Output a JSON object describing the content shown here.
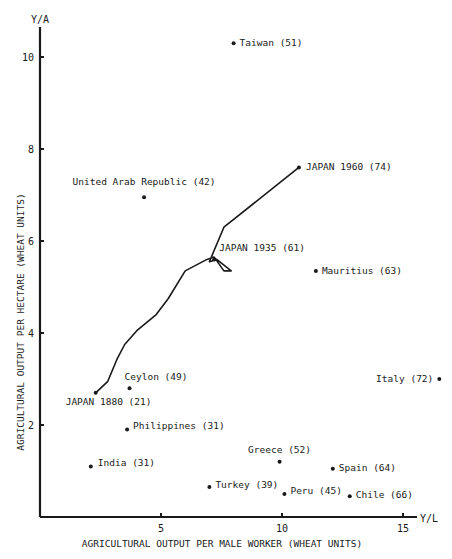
{
  "chart_data": {
    "type": "scatter",
    "title": "",
    "xlabel": "AGRICULTURAL OUTPUT PER MALE WORKER (WHEAT UNITS)",
    "ylabel": "AGRICULTURAL OUTPUT PER HECTARE (WHEAT UNITS)",
    "x_axis_end_label": "Y/L",
    "y_axis_end_label": "Y/A",
    "xlim": [
      0,
      16
    ],
    "ylim": [
      0,
      10.8
    ],
    "x_ticks": [
      5,
      10,
      15
    ],
    "y_ticks": [
      2,
      4,
      6,
      8,
      10
    ],
    "grid": false,
    "points": [
      {
        "label": "Taiwan (51)",
        "x": 8.0,
        "y": 10.3
      },
      {
        "label": "United Arab Republic (42)",
        "x": 4.3,
        "y": 6.95
      },
      {
        "label": "Mauritius (63)",
        "x": 11.4,
        "y": 5.35
      },
      {
        "label": "Ceylon (49)",
        "x": 3.7,
        "y": 2.8
      },
      {
        "label": "Italy (72)",
        "x": 16.5,
        "y": 3.0
      },
      {
        "label": "Philippines (31)",
        "x": 3.6,
        "y": 1.9
      },
      {
        "label": "India (31)",
        "x": 2.1,
        "y": 1.1
      },
      {
        "label": "Greece (52)",
        "x": 9.9,
        "y": 1.2
      },
      {
        "label": "Spain (64)",
        "x": 12.1,
        "y": 1.05
      },
      {
        "label": "Turkey (39)",
        "x": 7.0,
        "y": 0.65
      },
      {
        "label": "Peru (45)",
        "x": 10.1,
        "y": 0.5
      },
      {
        "label": "Chile (66)",
        "x": 12.8,
        "y": 0.45
      }
    ],
    "series": [
      {
        "name": "Japan 1880-1960",
        "labels": [
          {
            "label": "JAPAN 1880 (21)",
            "x": 2.3,
            "y": 2.7
          },
          {
            "label": "JAPAN 1935 (61)",
            "x": 7.2,
            "y": 5.6
          },
          {
            "label": "JAPAN 1960 (74)",
            "x": 10.7,
            "y": 7.6
          }
        ],
        "path": [
          [
            2.3,
            2.7
          ],
          [
            2.8,
            2.95
          ],
          [
            3.2,
            3.45
          ],
          [
            3.5,
            3.75
          ],
          [
            4.0,
            4.05
          ],
          [
            4.8,
            4.4
          ],
          [
            5.3,
            4.75
          ],
          [
            6.0,
            5.35
          ],
          [
            6.9,
            5.6
          ],
          [
            7.2,
            5.65
          ],
          [
            7.6,
            5.35
          ],
          [
            7.9,
            5.35
          ],
          [
            7.3,
            5.6
          ],
          [
            7.0,
            5.55
          ],
          [
            7.6,
            6.3
          ],
          [
            10.7,
            7.6
          ]
        ]
      }
    ]
  }
}
